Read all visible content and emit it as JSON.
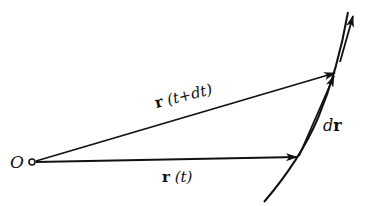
{
  "diagram": {
    "type": "vector-displacement",
    "colors": {
      "ink": "#111111",
      "background": "#ffffff"
    },
    "origin": {
      "label": "O",
      "x": 33,
      "y": 162
    },
    "vectors": [
      {
        "id": "r_t",
        "label_bold": "r",
        "label_arg": "(t)",
        "from": [
          33,
          162
        ],
        "to": [
          297,
          157
        ]
      },
      {
        "id": "r_t_dt",
        "label_bold": "r",
        "label_arg": "(t+dt)",
        "from": [
          33,
          162
        ],
        "to": [
          336,
          73
        ]
      },
      {
        "id": "dr",
        "label_prefix": "d",
        "label_bold": "r",
        "from": [
          297,
          157
        ],
        "to": [
          336,
          73
        ]
      }
    ],
    "curve": {
      "description": "trajectory",
      "direction_arrow": "up"
    }
  }
}
